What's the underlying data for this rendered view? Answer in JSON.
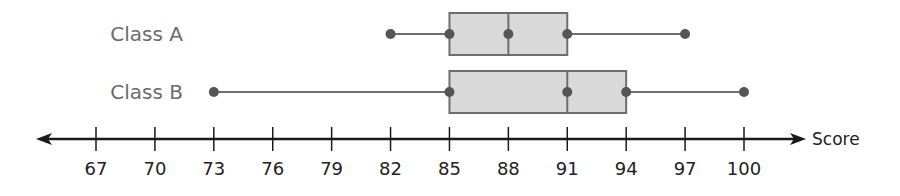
{
  "chart_data": {
    "type": "boxplot",
    "title": "",
    "xlabel": "Score",
    "ylabel": "",
    "xlim": [
      67,
      100
    ],
    "ticks": [
      67,
      70,
      73,
      76,
      79,
      82,
      85,
      88,
      91,
      94,
      97,
      100
    ],
    "grid": false,
    "legend": null,
    "orientation": "horizontal",
    "series": [
      {
        "name": "Class A",
        "min": 82,
        "q1": 85,
        "median": 88,
        "q3": 91,
        "max": 97
      },
      {
        "name": "Class B",
        "min": 73,
        "q1": 85,
        "median": 91,
        "q3": 94,
        "max": 100
      }
    ]
  },
  "colors": {
    "box_fill": "#d9d9d9",
    "box_stroke": "#6e6e6e",
    "whisker": "#6e6e6e",
    "point": "#555555",
    "axis": "#1a1a1a",
    "label": "#6b6b6b"
  }
}
